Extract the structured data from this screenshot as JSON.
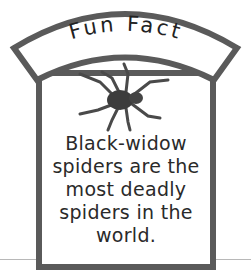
{
  "banner": {
    "title": "Fun Fact"
  },
  "fact": {
    "lines": [
      "Black-widow",
      "spiders are the",
      "most deadly",
      "spiders in the",
      "world."
    ]
  },
  "illustration": {
    "icon": "spider-icon"
  },
  "colors": {
    "frame": "#5a5a5a",
    "text": "#2a2a2a",
    "background": "#ffffff"
  }
}
